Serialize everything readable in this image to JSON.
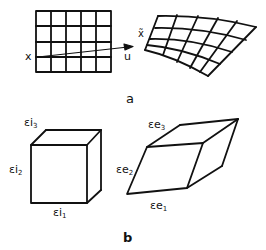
{
  "panels": {
    "a": {
      "label": "a",
      "point_label": "x",
      "vector_label": "u",
      "mapped_point_label": "x̃",
      "grid": {
        "columns": 5,
        "rows": 4
      }
    },
    "b": {
      "label": "b",
      "cube_edges": [
        {
          "sym": "εi",
          "sub": "3"
        },
        {
          "sym": "εi",
          "sub": "2"
        },
        {
          "sym": "εi",
          "sub": "1"
        }
      ],
      "parallelepiped_edges": [
        {
          "sym": "εe",
          "sub": "3"
        },
        {
          "sym": "εe",
          "sub": "2"
        },
        {
          "sym": "εe",
          "sub": "1"
        }
      ]
    }
  },
  "colors": {
    "stroke": "#111111",
    "background": "#ffffff"
  }
}
